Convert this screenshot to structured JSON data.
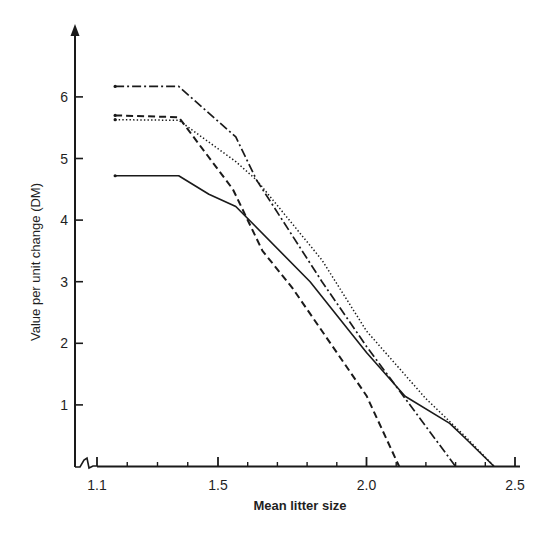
{
  "chart_data": {
    "type": "line",
    "title": "",
    "xlabel": "Mean litter size",
    "ylabel": "Value per unit change (DM)",
    "xlim": [
      1.0,
      2.55
    ],
    "ylim": [
      0,
      7
    ],
    "x_axis_break": true,
    "grid": false,
    "legend": null,
    "x_ticks_major": [
      {
        "value": 1.1,
        "label": "1.1"
      },
      {
        "value": 1.5,
        "label": "1.5"
      },
      {
        "value": 2.0,
        "label": "2.0"
      },
      {
        "value": 2.5,
        "label": "2.5"
      }
    ],
    "x_ticks_minor": [
      1.2,
      1.3,
      1.4,
      1.6,
      1.7,
      1.8,
      1.9,
      2.1,
      2.2,
      2.3,
      2.4
    ],
    "y_ticks": [
      {
        "value": 1,
        "label": "1"
      },
      {
        "value": 2,
        "label": "2"
      },
      {
        "value": 3,
        "label": "3"
      },
      {
        "value": 4,
        "label": "4"
      },
      {
        "value": 5,
        "label": "5"
      },
      {
        "value": 6,
        "label": "6"
      }
    ],
    "series": [
      {
        "name": "dash-dot series",
        "style": "dash-dot",
        "points": [
          [
            1.16,
            6.17
          ],
          [
            1.37,
            6.17
          ],
          [
            1.56,
            5.35
          ],
          [
            1.63,
            4.65
          ],
          [
            1.85,
            3.0
          ],
          [
            2.0,
            1.95
          ],
          [
            2.1,
            1.3
          ],
          [
            2.3,
            0
          ]
        ]
      },
      {
        "name": "dashed series",
        "style": "dashed",
        "points": [
          [
            1.16,
            5.7
          ],
          [
            1.37,
            5.67
          ],
          [
            1.55,
            4.5
          ],
          [
            1.65,
            3.5
          ],
          [
            1.75,
            2.9
          ],
          [
            1.85,
            2.2
          ],
          [
            2.0,
            1.15
          ],
          [
            2.11,
            0
          ]
        ]
      },
      {
        "name": "dotted series",
        "style": "dotted",
        "points": [
          [
            1.16,
            5.63
          ],
          [
            1.37,
            5.62
          ],
          [
            1.56,
            4.95
          ],
          [
            1.63,
            4.65
          ],
          [
            1.85,
            3.35
          ],
          [
            2.0,
            2.2
          ],
          [
            2.2,
            1.1
          ],
          [
            2.33,
            0.5
          ],
          [
            2.43,
            0
          ]
        ]
      },
      {
        "name": "solid series",
        "style": "solid",
        "points": [
          [
            1.16,
            4.72
          ],
          [
            1.37,
            4.72
          ],
          [
            1.47,
            4.42
          ],
          [
            1.56,
            4.22
          ],
          [
            1.81,
            3.0
          ],
          [
            2.0,
            1.85
          ],
          [
            2.13,
            1.14
          ],
          [
            2.28,
            0.7
          ],
          [
            2.33,
            0.47
          ],
          [
            2.43,
            0
          ]
        ]
      }
    ]
  },
  "colors": {
    "ink": "#1a1a1a",
    "background": "#ffffff"
  }
}
